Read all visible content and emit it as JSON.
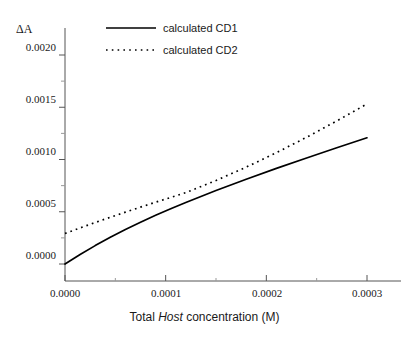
{
  "chart_data": {
    "type": "line",
    "title": "",
    "xlabel_prefix": "Total ",
    "xlabel_emphasis": "Host",
    "xlabel_suffix": " concentration (M)",
    "xlabel": "Total Host concentration (M)",
    "ylabel": "ΔA",
    "xlim": [
      0.0,
      0.0003
    ],
    "ylim": [
      -7.5e-05,
      0.00222
    ],
    "grid": false,
    "legend_position": "top-center",
    "xticks": [
      0.0,
      0.0001,
      0.0002,
      0.0003
    ],
    "xtick_labels": [
      "0.0000",
      "0.0001",
      "0.0002",
      "0.0003"
    ],
    "xminor_ticks": [
      5e-05,
      0.00015,
      0.00025
    ],
    "yticks": [
      0.0,
      0.0005,
      0.001,
      0.0015,
      0.002
    ],
    "ytick_labels": [
      "0.0000",
      "0.0005",
      "0.0010",
      "0.0015",
      "0.0020"
    ],
    "yminor_ticks": [
      0.00025,
      0.00075,
      0.00125,
      0.00175
    ],
    "series": [
      {
        "name": "calculated CD1",
        "style": "solid",
        "color": "#000000",
        "x": [
          0.0,
          1.5e-05,
          3e-05,
          4.5e-05,
          6e-05,
          7.5e-05,
          9e-05,
          0.000105,
          0.00012,
          0.00015,
          0.00018,
          0.00021,
          0.00024,
          0.00027,
          0.0003
        ],
        "y": [
          0.0,
          9.05e-05,
          0.000176,
          0.000256,
          0.000331,
          0.0004,
          0.000466,
          0.000529,
          0.000589,
          0.000703,
          0.000811,
          0.000915,
          0.001015,
          0.001113,
          0.001208
        ]
      },
      {
        "name": "calculated CD2",
        "style": "dotted",
        "color": "#000000",
        "x": [
          0.0,
          1.5e-05,
          3e-05,
          4.5e-05,
          6e-05,
          7.5e-05,
          9e-05,
          0.000105,
          0.00012,
          0.00015,
          0.00018,
          0.00021,
          0.00024,
          0.00027,
          0.0003
        ],
        "y": [
          0.000292,
          0.000345,
          0.000397,
          0.000447,
          0.000496,
          0.000544,
          0.000591,
          0.000637,
          0.000683,
          0.000799,
          0.000927,
          0.001065,
          0.001213,
          0.001369,
          0.001532
        ]
      }
    ]
  },
  "legend": {
    "items": [
      {
        "label": "calculated CD1",
        "style": "solid"
      },
      {
        "label": "calculated CD2",
        "style": "dotted"
      }
    ]
  }
}
